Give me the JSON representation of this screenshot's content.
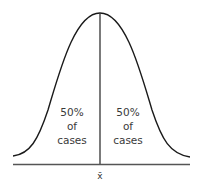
{
  "diagram": {
    "type": "normal-distribution-curve",
    "mean_label": "x̄",
    "left_region": {
      "line1": "50%",
      "line2": "of",
      "line3": "cases"
    },
    "right_region": {
      "line1": "50%",
      "line2": "of",
      "line3": "cases"
    },
    "colors": {
      "stroke": "#1a1a1a",
      "axis": "#555555",
      "text": "#3a3a3a"
    }
  }
}
